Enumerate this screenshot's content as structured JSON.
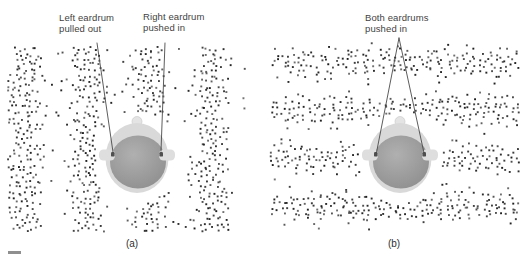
{
  "figure": {
    "background": "#ffffff",
    "text_color": "#3f3f3f",
    "caption_color": "#2e2e2e",
    "dot_color": "#1c1c1c",
    "leader_color": "#4a4a4a",
    "footer_dash_color": "#8f8f8f",
    "head_colors": {
      "outline": "#d9d9d9",
      "skin": "#e4e4e4",
      "ear": "#dedede",
      "hair_inner": "#b0b0b0",
      "hair_outer": "#8c8c8c",
      "canal": "#4f4f4f"
    },
    "panels": [
      {
        "id": "a",
        "caption": "(a)",
        "labels": [
          {
            "name": "left-eardrum-label",
            "line1": "Left eardrum",
            "line2": "pulled out"
          },
          {
            "name": "right-eardrum-label",
            "line1": "Right eardrum",
            "line2": "pushed in"
          }
        ],
        "wave": {
          "bands": "vertical",
          "travel": "horizontal"
        },
        "field": {
          "x": 4,
          "y": 47,
          "w": 242,
          "h": 188
        },
        "bands": {
          "axis": "x",
          "wavelength": 62,
          "peak": 145
        },
        "seed": 20,
        "head": {
          "cx": 133,
          "cy": 158
        },
        "leaders": [
          {
            "x1": 93,
            "y1": 43,
            "x2": 109,
            "y2": 152
          },
          {
            "x1": 161,
            "y1": 43,
            "x2": 157,
            "y2": 151
          }
        ]
      },
      {
        "id": "b",
        "caption": "(b)",
        "labels": [
          {
            "name": "both-eardrums-label",
            "line1": "Both eardrums",
            "line2": "pushed in"
          }
        ],
        "wave": {
          "bands": "horizontal",
          "travel": "vertical"
        },
        "field": {
          "x": 5,
          "y": 43,
          "w": 249,
          "h": 190
        },
        "bands": {
          "axis": "y",
          "wavelength": 48,
          "peak": 158
        },
        "seed": 77,
        "head": {
          "cx": 134,
          "cy": 158
        },
        "leaders": [
          {
            "x1": 133,
            "y1": 38,
            "x2": 110,
            "y2": 155
          },
          {
            "x1": 133,
            "y1": 38,
            "x2": 158,
            "y2": 153
          }
        ]
      }
    ]
  }
}
